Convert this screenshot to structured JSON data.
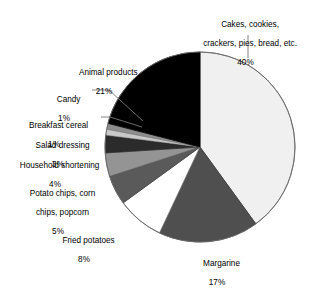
{
  "chart_data": {
    "type": "pie",
    "title": "",
    "subtitle": "",
    "xlabel": "",
    "ylabel": "",
    "legend_position": "none",
    "grid": false,
    "units": "percent",
    "start_angle_deg": 0,
    "direction": "clockwise",
    "categories": [
      "Cakes, cookies, crackers, pies, bread, etc.",
      "Margarine",
      "Fried potatoes",
      "Potato chips, corn chips, popcorn",
      "Household shortening",
      "Salad dressing",
      "Breakfast cereal",
      "Candy",
      "Animal products"
    ],
    "values": [
      40,
      17,
      8,
      5,
      4,
      3,
      1,
      1,
      21
    ],
    "colors": [
      "#f0f0f0",
      "#4f4f4f",
      "#ffffff",
      "#5a5a5a",
      "#949494",
      "#2b2b2b",
      "#c9c9c9",
      "#8d8d8d",
      "#000000"
    ],
    "slices": [
      {
        "label": "Cakes, cookies, crackers, pies, bread, etc.",
        "value": 40,
        "value_text": "40%",
        "color": "#f0f0f0"
      },
      {
        "label": "Margarine",
        "value": 17,
        "value_text": "17%",
        "color": "#4f4f4f"
      },
      {
        "label": "Fried potatoes",
        "value": 8,
        "value_text": "8%",
        "color": "#ffffff"
      },
      {
        "label": "Potato chips, corn chips, popcorn",
        "value": 5,
        "value_text": "5%",
        "color": "#5a5a5a"
      },
      {
        "label": "Household shortening",
        "value": 4,
        "value_text": "4%",
        "color": "#949494"
      },
      {
        "label": "Salad dressing",
        "value": 3,
        "value_text": "3%",
        "color": "#2b2b2b"
      },
      {
        "label": "Breakfast cereal",
        "value": 1,
        "value_text": "1%",
        "color": "#c9c9c9"
      },
      {
        "label": "Candy",
        "value": 1,
        "value_text": "1%",
        "color": "#8d8d8d"
      },
      {
        "label": "Animal products",
        "value": 21,
        "value_text": "21%",
        "color": "#000000"
      }
    ]
  },
  "labels": {
    "cakes": {
      "line1": "Cakes, cookies,",
      "line2": "crackers, pies, bread, etc.",
      "pct": "40%"
    },
    "animal_products": {
      "line1": "Animal products",
      "pct": "21%"
    },
    "candy": {
      "line1": "Candy",
      "pct": "1%"
    },
    "breakfast_cereal": {
      "line1": "Breakfast cereal",
      "pct": "1%"
    },
    "salad_dressing": {
      "line1": "Salad dressing",
      "pct": "3%"
    },
    "household_shortening": {
      "line1": "Household shortening",
      "pct": "4%"
    },
    "potato_chips": {
      "line1": "Potato chips, corn",
      "line2": "chips, popcorn",
      "pct": "5%"
    },
    "fried_potatoes": {
      "line1": "Fried potatoes",
      "pct": "8%"
    },
    "margarine": {
      "line1": "Margarine",
      "pct": "17%"
    }
  },
  "style": {
    "outline_color": "#6a6a6a",
    "leader_color": "#777777",
    "background": "#ffffff"
  }
}
